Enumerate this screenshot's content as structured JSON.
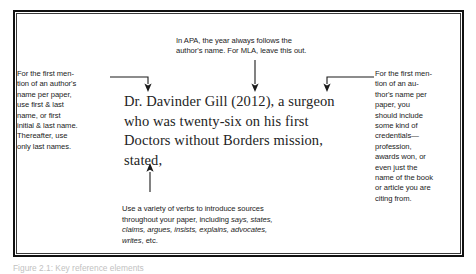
{
  "figure": {
    "example_sentence": "Dr. Davinder Gill (2012), a surgeon who was twenty-six on his first Doctors without Borders mission, stated,",
    "callouts": {
      "top": "In APA, the year always follows the\nauthor's name. For MLA, leave this out.",
      "left": "For the first men-\ntion of an author's\nname per paper,\nuse first & last\nname, or first\ninitial & last name.\nThereafter, use\nonly last names.",
      "right": "For the first men-\ntion of an au-\nthor's name per\npaper, you\nshould include\nsome kind of\ncredentials—\nprofession,\nawards won, or\neven just the\nname of the book\nor article you are\nciting from.",
      "bottom_intro": "Use a variety of verbs to introduce sources\nthroughout your paper, including ",
      "bottom_verbs": "says, states,\nclaims, argues, insists, explains, advocates,\nwrites",
      "bottom_tail": ", etc."
    }
  },
  "caption": {
    "text": "Figure 2.1: Key reference elements"
  },
  "colors": {
    "border": "#111111",
    "annotation_text": "#1b1b1b",
    "example_text": "#232323",
    "arrow": "#1b1b1b",
    "page_background": "#ffffff"
  }
}
